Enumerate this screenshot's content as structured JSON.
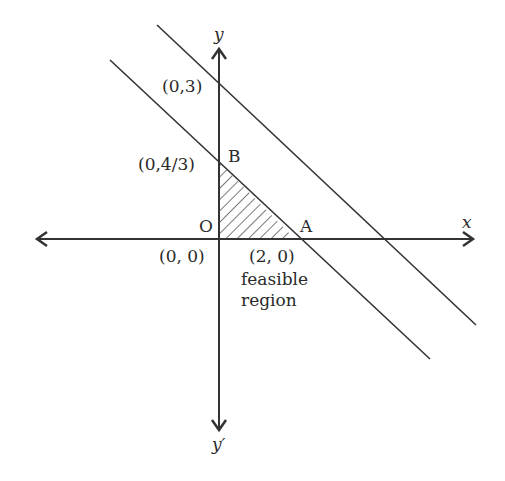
{
  "diagram": {
    "type": "linear-programming-feasible-region",
    "axes": {
      "x_label": "x",
      "y_label": "y",
      "y_neg_label": "y′"
    },
    "points": {
      "origin": {
        "name": "O",
        "coord": "(0, 0)"
      },
      "A": {
        "name": "A",
        "coord": "(2, 0)"
      },
      "B": {
        "name": "B",
        "coord": "(0,4/3)"
      },
      "C": {
        "coord": "(0,3)"
      }
    },
    "region_label_line1": "feasible",
    "region_label_line2": "region",
    "colors": {
      "line": "#333333",
      "text": "#2a2a2a",
      "background": "#ffffff"
    }
  }
}
